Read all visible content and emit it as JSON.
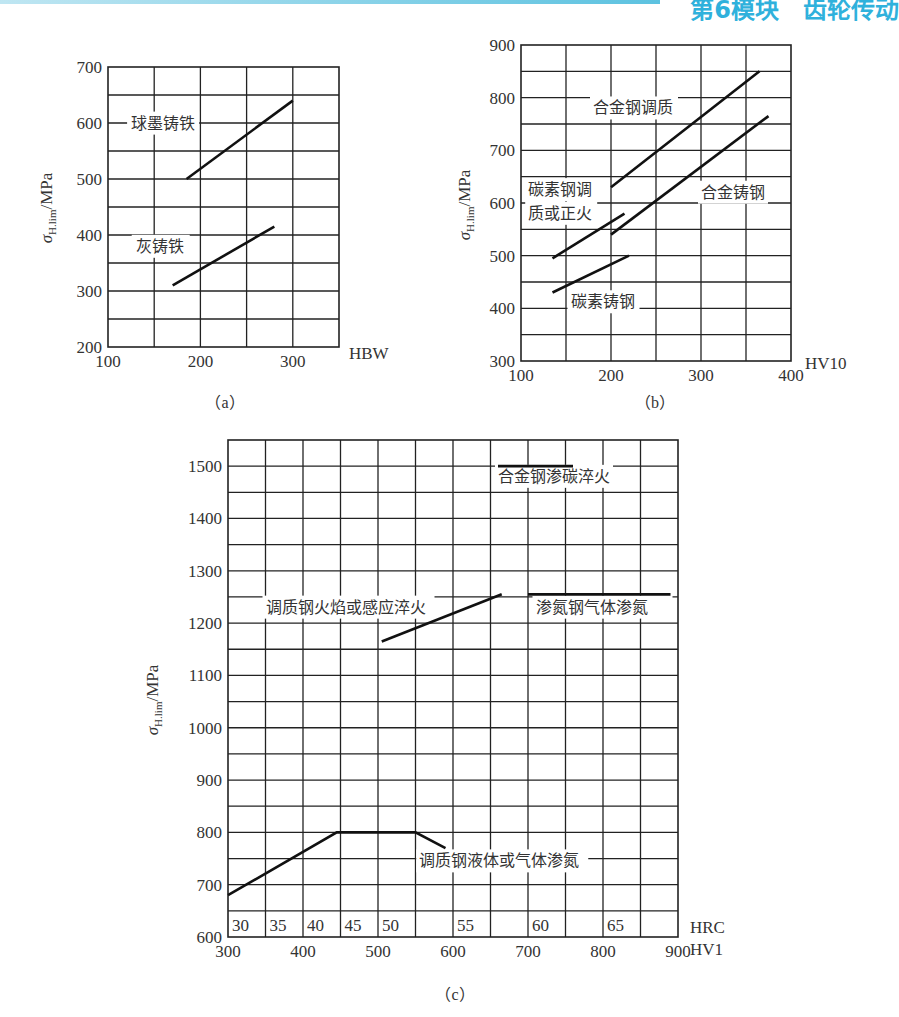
{
  "header": {
    "title": "第6模块　齿轮传动"
  },
  "chart_data": [
    {
      "id": "a",
      "type": "line",
      "caption": "（a）",
      "xlabel": "HBW",
      "ylabel": "σH.lim/MPa",
      "ylabel_symbol": "σ",
      "ylabel_sub": "H.lim",
      "ylabel_unit": "/MPa",
      "xlim": [
        100,
        350
      ],
      "ylim": [
        200,
        700
      ],
      "xgrid_step": 50,
      "ygrid_step": 50,
      "xticks": [
        100,
        200,
        300
      ],
      "yticks": [
        200,
        300,
        400,
        500,
        600,
        700
      ],
      "grid": true,
      "series": [
        {
          "name": "球墨铸铁",
          "points": [
            [
              185,
              500
            ],
            [
              300,
              640
            ]
          ]
        },
        {
          "name": "灰铸铁",
          "points": [
            [
              170,
              310
            ],
            [
              280,
              415
            ]
          ]
        }
      ],
      "annotations": [
        {
          "text": "球墨铸铁",
          "x": 125,
          "y": 590
        },
        {
          "text": "灰铸铁",
          "x": 130,
          "y": 370
        }
      ]
    },
    {
      "id": "b",
      "type": "line",
      "caption": "（b）",
      "xlabel": "HV10",
      "ylabel": "σH.lim/MPa",
      "ylabel_symbol": "σ",
      "ylabel_sub": "H.lim",
      "ylabel_unit": "/MPa",
      "xlim": [
        100,
        400
      ],
      "ylim": [
        300,
        900
      ],
      "xgrid_step": 50,
      "ygrid_step": 50,
      "xticks": [
        100,
        200,
        300,
        400
      ],
      "yticks": [
        300,
        400,
        500,
        600,
        700,
        800,
        900
      ],
      "grid": true,
      "series": [
        {
          "name": "合金钢调质",
          "points": [
            [
              200,
              630
            ],
            [
              365,
              850
            ]
          ]
        },
        {
          "name": "合金铸钢",
          "points": [
            [
              200,
              540
            ],
            [
              375,
              765
            ]
          ]
        },
        {
          "name": "碳素钢调质或正火",
          "points": [
            [
              135,
              495
            ],
            [
              215,
              580
            ]
          ]
        },
        {
          "name": "碳素铸钢",
          "points": [
            [
              135,
              430
            ],
            [
              220,
              500
            ]
          ]
        }
      ],
      "annotations": [
        {
          "text": "合金钢调质",
          "x": 180,
          "y": 770
        },
        {
          "text": "合金铸钢",
          "x": 300,
          "y": 610
        },
        {
          "text": "碳素钢调",
          "x": 108,
          "y": 615
        },
        {
          "text": "质或正火",
          "x": 108,
          "y": 570
        },
        {
          "text": "碳素铸钢",
          "x": 155,
          "y": 402
        }
      ]
    },
    {
      "id": "c",
      "type": "line",
      "caption": "（c）",
      "xlabel": "HV1",
      "xlabel2": "HRC",
      "ylabel": "σH.lim/MPa",
      "ylabel_symbol": "σ",
      "ylabel_sub": "H.lim",
      "ylabel_unit": "/MPa",
      "xlim": [
        300,
        900
      ],
      "ylim": [
        600,
        1550
      ],
      "xgrid_step": 50,
      "ygrid_step": 50,
      "xticks": [
        300,
        400,
        500,
        600,
        700,
        800,
        900
      ],
      "yticks": [
        600,
        700,
        800,
        900,
        1000,
        1100,
        1200,
        1300,
        1400,
        1500
      ],
      "hrc_ticks": [
        {
          "label": "30",
          "hv": 300
        },
        {
          "label": "35",
          "hv": 350
        },
        {
          "label": "40",
          "hv": 400
        },
        {
          "label": "45",
          "hv": 450
        },
        {
          "label": "50",
          "hv": 500
        },
        {
          "label": "55",
          "hv": 600
        },
        {
          "label": "60",
          "hv": 700
        },
        {
          "label": "65",
          "hv": 800
        }
      ],
      "hrc_dividers": [
        300,
        350,
        400,
        450,
        500,
        550,
        600,
        650,
        700,
        750,
        800,
        850,
        900
      ],
      "grid": true,
      "series": [
        {
          "name": "合金钢渗碳淬火",
          "points": [
            [
              660,
              1500
            ],
            [
              760,
              1500
            ]
          ]
        },
        {
          "name": "调质钢火焰或感应淬火",
          "points": [
            [
              505,
              1165
            ],
            [
              665,
              1255
            ]
          ]
        },
        {
          "name": "渗氮钢气体渗氮",
          "points": [
            [
              700,
              1255
            ],
            [
              890,
              1255
            ]
          ]
        },
        {
          "name": "调质钢液体或气体渗氮",
          "points": [
            [
              300,
              680
            ],
            [
              445,
              800
            ],
            [
              550,
              800
            ],
            [
              590,
              770
            ]
          ]
        }
      ],
      "annotations": [
        {
          "text": "合金钢渗碳淬火",
          "x": 660,
          "y": 1470
        },
        {
          "text": "调质钢火焰或感应淬火",
          "x": 350,
          "y": 1220
        },
        {
          "text": "渗氮钢气体渗氮",
          "x": 710,
          "y": 1220
        },
        {
          "text": "调质钢液体或气体渗氮",
          "x": 555,
          "y": 735
        }
      ]
    }
  ]
}
